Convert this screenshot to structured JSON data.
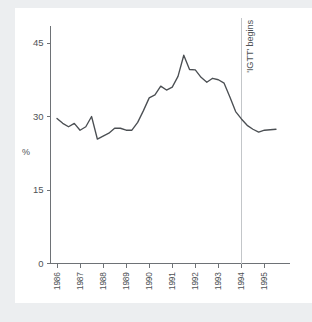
{
  "chart_data": {
    "type": "line",
    "title": "",
    "subtitle": "",
    "xlabel": "",
    "ylabel": "%",
    "ylim": [
      0,
      48
    ],
    "xlim": [
      1986.0,
      1995.75
    ],
    "grid": false,
    "legend": null,
    "y_ticks": [
      0,
      15,
      30,
      45
    ],
    "y_tick_labels": [
      "0",
      "15",
      "30",
      "45"
    ],
    "x_ticks": [
      1986,
      1987,
      1988,
      1989,
      1990,
      1991,
      1992,
      1993,
      1994,
      1995
    ],
    "x_tick_labels": [
      "1986",
      "1987",
      "1988",
      "1989",
      "1990",
      "1991",
      "1992",
      "1993",
      "1994",
      "1995"
    ],
    "annotations": [
      {
        "label": "'IGTT' begins",
        "x": 1994.0,
        "type": "vertical-reference-line",
        "orientation": "vertical-text",
        "color": "#c3c6c9"
      }
    ],
    "series": [
      {
        "name": "share",
        "color": "#4b4f53",
        "x": [
          1986.0,
          1986.25,
          1986.5,
          1986.75,
          1987.0,
          1987.25,
          1987.5,
          1987.75,
          1988.0,
          1988.25,
          1988.5,
          1988.75,
          1989.0,
          1989.25,
          1989.5,
          1989.75,
          1990.0,
          1990.25,
          1990.5,
          1990.75,
          1991.0,
          1991.25,
          1991.5,
          1991.75,
          1992.0,
          1992.25,
          1992.5,
          1992.75,
          1993.0,
          1993.25,
          1993.5,
          1993.75,
          1994.0,
          1994.25,
          1994.5,
          1994.75,
          1995.0,
          1995.25,
          1995.5
        ],
        "values": [
          29.6,
          28.6,
          27.9,
          28.6,
          27.2,
          27.9,
          30.0,
          25.4,
          26.0,
          26.6,
          27.6,
          27.6,
          27.2,
          27.2,
          28.8,
          31.2,
          33.8,
          34.4,
          36.2,
          35.4,
          36.0,
          38.2,
          42.5,
          39.6,
          39.5,
          38.0,
          37.0,
          37.8,
          37.5,
          36.8,
          34.0,
          31.0,
          29.5,
          28.2,
          27.4,
          26.8,
          27.2,
          27.3,
          27.4
        ]
      }
    ]
  }
}
